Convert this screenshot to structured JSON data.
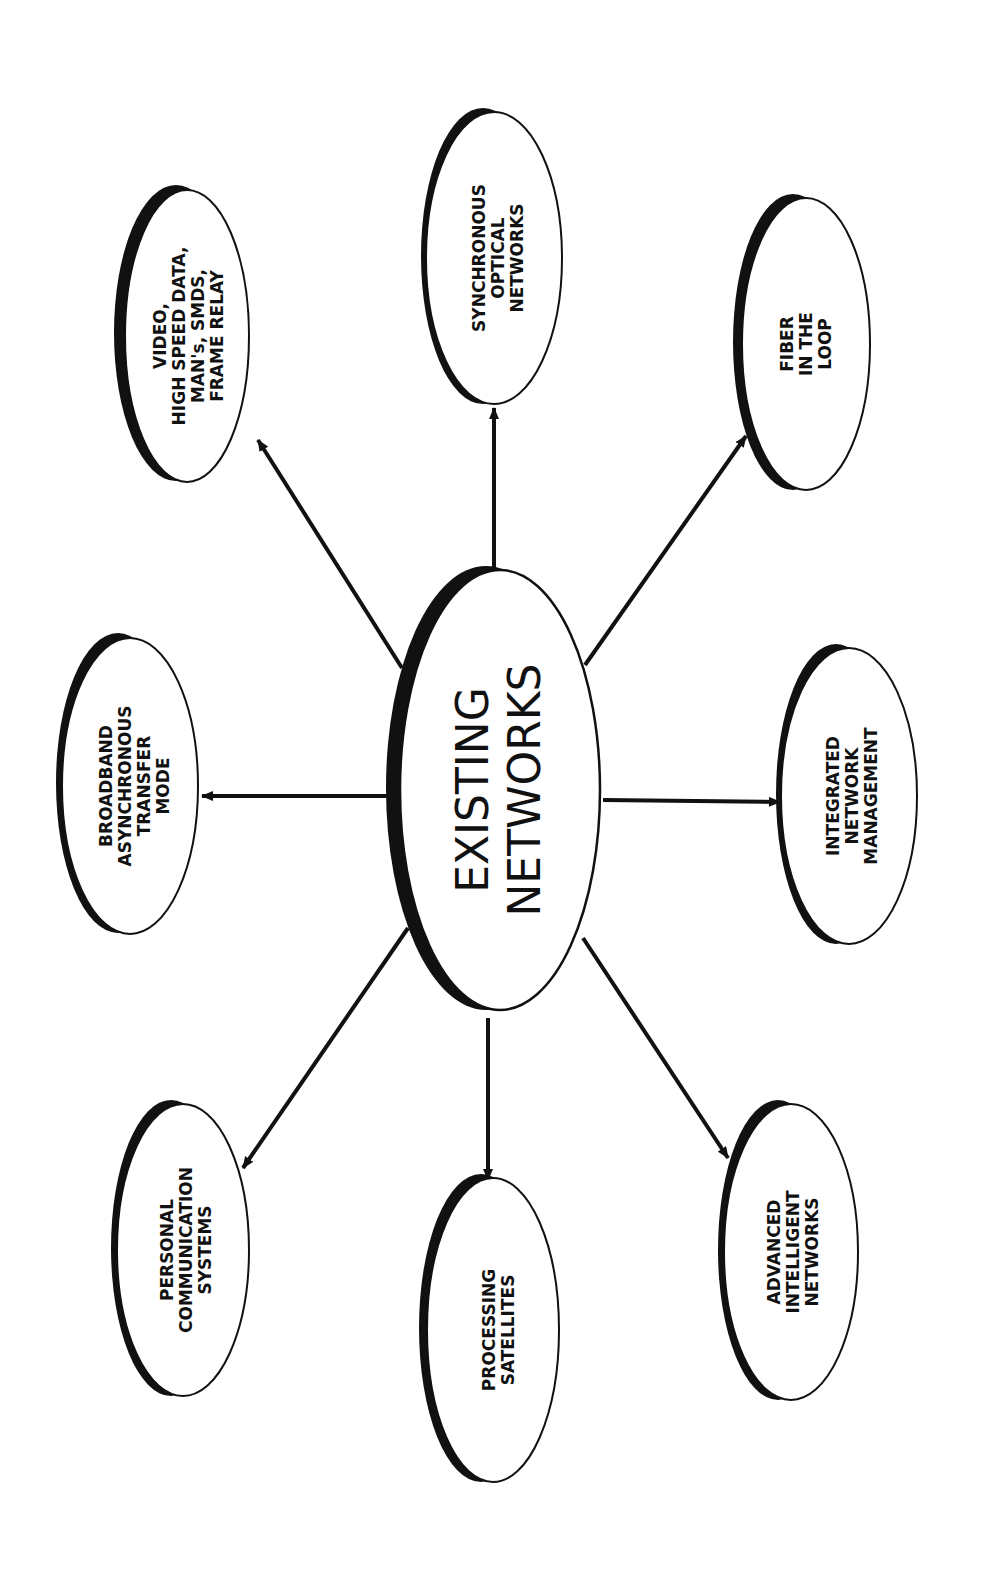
{
  "diagram": {
    "type": "hub-and-spoke",
    "orientation": "rotated 90deg counter-clockwise (text reads bottom-to-top)",
    "colors": {
      "background": "#ffffff",
      "ink": "#111111",
      "shadow": "#111111"
    },
    "center": {
      "id": "existing-networks",
      "lines": [
        "EXISTING",
        "NETWORKS"
      ]
    },
    "nodes": [
      {
        "id": "video-high-speed-data",
        "lines": [
          "VIDEO,",
          "HIGH SPEED DATA,",
          "MAN's, SMDS,",
          "FRAME RELAY"
        ]
      },
      {
        "id": "synchronous-optical-networks",
        "lines": [
          "SYNCHRONOUS",
          "OPTICAL",
          "NETWORKS"
        ]
      },
      {
        "id": "fiber-in-the-loop",
        "lines": [
          "FIBER",
          "IN THE",
          "LOOP"
        ]
      },
      {
        "id": "broadband-atm",
        "lines": [
          "BROADBAND",
          "ASYNCHRONOUS",
          "TRANSFER",
          "MODE"
        ]
      },
      {
        "id": "integrated-network-management",
        "lines": [
          "INTEGRATED",
          "NETWORK",
          "MANAGEMENT"
        ]
      },
      {
        "id": "personal-communication-systems",
        "lines": [
          "PERSONAL",
          "COMMUNICATION",
          "SYSTEMS"
        ]
      },
      {
        "id": "processing-satellites",
        "lines": [
          "PROCESSING",
          "SATELLITES"
        ]
      },
      {
        "id": "advanced-intelligent-networks",
        "lines": [
          "ADVANCED",
          "INTELLIGENT",
          "NETWORKS"
        ]
      }
    ],
    "edges": [
      {
        "from": "existing-networks",
        "to": "video-high-speed-data",
        "arrow": "to"
      },
      {
        "from": "existing-networks",
        "to": "synchronous-optical-networks",
        "arrow": "to"
      },
      {
        "from": "existing-networks",
        "to": "fiber-in-the-loop",
        "arrow": "to"
      },
      {
        "from": "existing-networks",
        "to": "broadband-atm",
        "arrow": "to"
      },
      {
        "from": "existing-networks",
        "to": "integrated-network-management",
        "arrow": "to"
      },
      {
        "from": "existing-networks",
        "to": "personal-communication-systems",
        "arrow": "to"
      },
      {
        "from": "existing-networks",
        "to": "processing-satellites",
        "arrow": "to"
      },
      {
        "from": "existing-networks",
        "to": "advanced-intelligent-networks",
        "arrow": "to"
      }
    ]
  }
}
